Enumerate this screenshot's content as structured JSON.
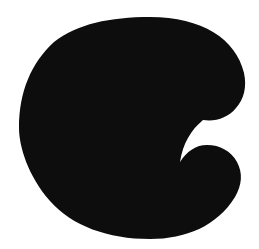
{
  "image": {
    "kind": "letterform-glyph-scan",
    "character": "C",
    "case": "uppercase",
    "style": "bold-slab-grotesque",
    "width": 259,
    "height": 249,
    "background_color": "#ffffff",
    "glyph_color": "#0d0d0d",
    "alt_text": "C"
  },
  "glyph": {
    "name": "letter-c",
    "label": "C",
    "bounding_box": {
      "left": 19,
      "top": 18,
      "right": 245,
      "bottom": 238,
      "width": 226,
      "height": 220
    },
    "stroke_weight_px": 83,
    "counter": {
      "name": "counter-aperture",
      "shape": "tilted-egg",
      "left": 103,
      "top": 58,
      "right": 215,
      "bottom": 190
    },
    "terminals": [
      {
        "name": "upper-terminal",
        "x": 214,
        "y": 118,
        "shape": "blunt-rounded"
      },
      {
        "name": "lower-terminal",
        "x": 219,
        "y": 157,
        "shape": "blunt-rounded"
      }
    ],
    "outline_path": "M 150 17 C 202 17 236 39 244 73 C 247 87 244 99 236 108 C 228 118 215 122 203 120 C 190 118 182 110 175 99 C 165 82 152 73 134 73 C 118 73 106 81 99 96 C 92 110 89 125 90 140 C 91 157 97 170 108 179 C 118 187 130 190 142 188 C 159 186 171 177 180 162 C 187 151 196 145 207 145 C 220 145 231 151 237 162 C 243 173 242 185 235 197 C 217 226 186 239 150 239 C 108 239 72 226 50 201 C 28 176 19 146 19 128 C 19 92 31 63 54 42 C 77 24 110 17 150 17 Z",
    "counter_path": "M 134 73 C 152 73 165 82 175 99 C 182 110 190 118 203 120 C 191 130 183 143 180 162 C 171 177 159 186 142 188 C 130 190 118 187 108 179 C 97 170 91 157 90 140 C 89 125 92 110 99 96 C 106 81 118 73 134 73 Z"
  }
}
